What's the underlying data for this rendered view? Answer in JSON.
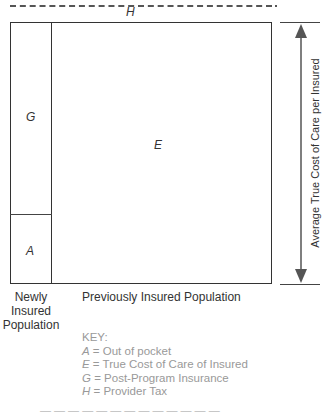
{
  "diagram": {
    "top_label": "H",
    "regions": {
      "G": "G",
      "A": "A",
      "E": "E"
    },
    "axis_label": "Average True Cost of Care per Insured",
    "bottom_labels": {
      "newly": [
        "Newly",
        "Insured",
        "Population"
      ],
      "previously": "Previously Insured Population"
    },
    "key": {
      "title": "KEY:",
      "items": [
        {
          "sym": "A",
          "text": " = Out of pocket"
        },
        {
          "sym": "E",
          "text": " = True Cost of Care of Insured"
        },
        {
          "sym": "G",
          "text": " = Post-Program Insurance"
        },
        {
          "sym": "H",
          "text": " = Provider Tax"
        }
      ]
    },
    "caption_cut": "— — — — — — — — — — — — —"
  }
}
